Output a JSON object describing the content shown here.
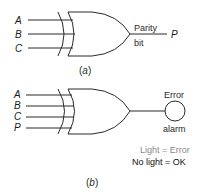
{
  "figure_a": {
    "caption_open": "(",
    "caption_letter": "a",
    "caption_close": ")",
    "gate_type": "XOR",
    "inputs": [
      "A",
      "B",
      "C"
    ],
    "output_label_top": "Parity",
    "output_label_bottom": "bit",
    "output_name": "P"
  },
  "figure_b": {
    "caption_open": "(",
    "caption_letter": "b",
    "caption_close": ")",
    "gate_type": "XOR",
    "inputs": [
      "A",
      "B",
      "C",
      "P"
    ],
    "indicator_label_top": "Error",
    "indicator_label_bottom": "alarm",
    "legend": {
      "line1": "Light = Error",
      "line2": "No light = OK"
    }
  },
  "colors": {
    "line": "#2a2a2a",
    "legend_gray": "#8a8a8a",
    "legend_black": "#111111",
    "background": "#ffffff"
  }
}
